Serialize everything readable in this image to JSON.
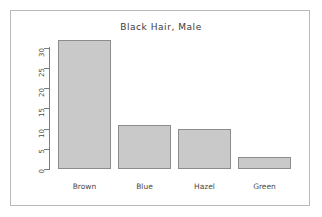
{
  "chart_data": {
    "type": "bar",
    "title": "Black Hair, Male",
    "xlabel": "",
    "ylabel": "",
    "categories": [
      "Brown",
      "Blue",
      "Hazel",
      "Green"
    ],
    "values": [
      32,
      11,
      10,
      3
    ],
    "ylim": [
      0,
      32
    ],
    "yticks": [
      0,
      5,
      10,
      15,
      20,
      25,
      30
    ],
    "ytick_labels": [
      "0",
      "5",
      "10",
      "15",
      "20",
      "25",
      "30"
    ],
    "grid": false,
    "legend": false,
    "legend_position": "none",
    "bar_fill_color": "#c9c9c9",
    "bar_border_color": "#8c8c8c",
    "axis_color": "#7d7d7d",
    "text_color": "#4a4a4a",
    "frame_color": "#b9b9b9",
    "background_color": "#ffffff",
    "ytick_label_rotation": 90
  }
}
